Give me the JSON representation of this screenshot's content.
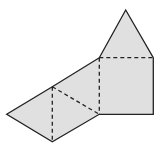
{
  "diagram": {
    "fill": "#e0e0e0",
    "stroke": "#222222",
    "points": {
      "apex": [
        125.7,
        10
      ],
      "sq_tl": [
        99.3,
        57.7
      ],
      "sq_tr": [
        153.3,
        57.7
      ],
      "sq_br": [
        153.3,
        114.3
      ],
      "sq_bl": [
        99.3,
        114.3
      ],
      "mid_top": [
        52.3,
        86.7
      ],
      "left": [
        6.7,
        114.3
      ],
      "bottom": [
        52.3,
        141.7
      ]
    }
  }
}
